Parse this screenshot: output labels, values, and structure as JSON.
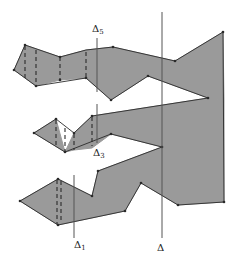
{
  "diagram": {
    "colors": {
      "fill": "#9a9a9a",
      "stroke": "#2a2a2a",
      "line": "#555555",
      "background": "#ffffff"
    },
    "polygon_points": "14,70 25,45 60,57 86,50 113,47 175,61 223,32 224,202 178,205 141,183 125,211 58,225 20,201 58,179 92,196 98,171 162,147 111,134 92,116 74,133 65,152 56,119 34,133 56,119 65,152 74,133 92,116 111,134 162,147 208,98 148,76 111,100 86,78 60,80 36,86",
    "shapes": [
      {
        "name": "top-arm",
        "points": "14,70 25,45 60,57 86,50 113,47 175,61 223,32 224,100 208,98 148,76 111,100 86,78 60,80 36,86"
      },
      {
        "name": "middle-arm",
        "points": "34,133 56,119 65,152 74,133 92,116 208,98 224,100 224,147 162,147 111,134 92,148 74,150 65,152"
      },
      {
        "name": "bottom-arm",
        "points": "20,201 58,179 92,196 98,171 162,147 224,147 224,202 178,205 141,183 125,211 58,225"
      }
    ],
    "vertices": [
      [
        14,
        70
      ],
      [
        25,
        45
      ],
      [
        36,
        86
      ],
      [
        60,
        57
      ],
      [
        60,
        80
      ],
      [
        86,
        78
      ],
      [
        113,
        47
      ],
      [
        111,
        100
      ],
      [
        148,
        76
      ],
      [
        175,
        61
      ],
      [
        223,
        32
      ],
      [
        208,
        98
      ],
      [
        34,
        133
      ],
      [
        56,
        119
      ],
      [
        65,
        152
      ],
      [
        74,
        133
      ],
      [
        92,
        116
      ],
      [
        111,
        134
      ],
      [
        162,
        147
      ],
      [
        20,
        201
      ],
      [
        58,
        179
      ],
      [
        58,
        225
      ],
      [
        92,
        196
      ],
      [
        98,
        171
      ],
      [
        125,
        211
      ],
      [
        141,
        183
      ],
      [
        178,
        205
      ],
      [
        224,
        202
      ]
    ],
    "dashed_lines": [
      {
        "x1": 25,
        "y1": 46,
        "x2": 25,
        "y2": 78
      },
      {
        "x1": 36,
        "y1": 50,
        "x2": 36,
        "y2": 85
      },
      {
        "x1": 60,
        "y1": 57,
        "x2": 60,
        "y2": 80
      },
      {
        "x1": 86,
        "y1": 52,
        "x2": 86,
        "y2": 78
      },
      {
        "x1": 56,
        "y1": 120,
        "x2": 56,
        "y2": 146
      },
      {
        "x1": 65,
        "y1": 128,
        "x2": 65,
        "y2": 151
      },
      {
        "x1": 74,
        "y1": 134,
        "x2": 74,
        "y2": 150
      },
      {
        "x1": 92,
        "y1": 117,
        "x2": 92,
        "y2": 146
      },
      {
        "x1": 57,
        "y1": 180,
        "x2": 57,
        "y2": 224
      },
      {
        "x1": 61,
        "y1": 181,
        "x2": 61,
        "y2": 223
      }
    ],
    "cut_lines": [
      {
        "name": "delta-5-line",
        "x": 97,
        "y1": 38,
        "y2": 92,
        "label": "Δ",
        "sub": "5",
        "label_x": 92,
        "label_y": 32
      },
      {
        "name": "delta-3-line",
        "x": 97,
        "y1": 104,
        "y2": 143,
        "label": "Δ",
        "sub": "3",
        "label_x": 93,
        "label_y": 156
      },
      {
        "name": "delta-1-line",
        "x": 74,
        "y1": 175,
        "y2": 238,
        "label": "Δ",
        "sub": "1",
        "label_x": 74,
        "label_y": 248
      },
      {
        "name": "delta-line",
        "x": 162,
        "y1": 12,
        "y2": 238,
        "label": "Δ",
        "sub": "",
        "label_x": 157,
        "label_y": 251
      }
    ]
  }
}
